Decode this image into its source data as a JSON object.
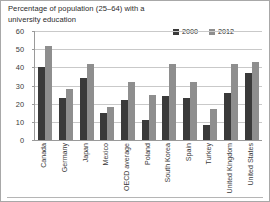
{
  "chart_data": {
    "type": "bar",
    "title": "Percentage of population (25–64) with a\nuniversity education",
    "xlabel": "",
    "ylabel": "",
    "ylim": [
      0,
      60
    ],
    "yticks": [
      0,
      10,
      20,
      30,
      40,
      50,
      60
    ],
    "grid": true,
    "legend_position": "top-right",
    "categories": [
      "Canada",
      "Germany",
      "Japan",
      "Mexico",
      "OECD average",
      "Poland",
      "South Korea",
      "Spain",
      "Turkey",
      "United Kingdom",
      "United States"
    ],
    "series": [
      {
        "name": "2000",
        "color": "#3a3a3a",
        "values": [
          40,
          23,
          34,
          15,
          22,
          11,
          24,
          23,
          8,
          26,
          37
        ]
      },
      {
        "name": "2012",
        "color": "#8e8e8e",
        "values": [
          52,
          28,
          42,
          18,
          32,
          25,
          42,
          32,
          17,
          42,
          43
        ]
      }
    ]
  },
  "legend": {
    "items": [
      {
        "label": "2000",
        "color": "#3a3a3a"
      },
      {
        "label": "2012",
        "color": "#8e8e8e"
      }
    ]
  }
}
